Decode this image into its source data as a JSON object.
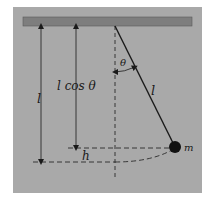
{
  "diagram": {
    "type": "pendulum",
    "labels": {
      "length_left": "l",
      "length_cos": "l cos θ",
      "angle": "θ",
      "string_length": "l",
      "height": "h",
      "mass": "m"
    },
    "colors": {
      "page_background": "#ffffff",
      "panel_background": "#a9a9a9",
      "ceiling": "#7e7e7e",
      "ink": "#1a1a1a"
    },
    "geometry": {
      "panel": {
        "x": 13,
        "y": 7,
        "width": 189,
        "height": 186
      },
      "ceiling": {
        "x": 23,
        "y": 17,
        "width": 169,
        "height": 9
      },
      "pivot": {
        "x": 115,
        "y": 26
      },
      "bob": {
        "x": 175,
        "y": 147,
        "r": 6
      },
      "vertical_axis_bottom_y": 180,
      "level_cos_y": 148,
      "level_bottom_y": 162,
      "arrow_l_x": 41,
      "arrow_lcos_x": 76
    }
  }
}
